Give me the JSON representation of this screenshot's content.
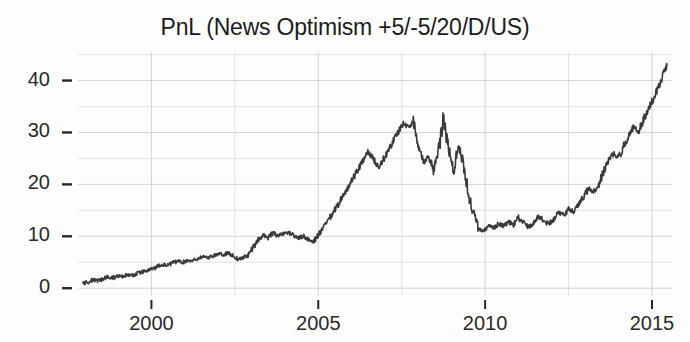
{
  "chart_data": {
    "type": "line",
    "title": "PnL (News Optimism +5/-5/20/D/US)",
    "xlabel": "",
    "ylabel": "",
    "xlim": [
      1997.8,
      2015.6
    ],
    "ylim": [
      -1.5,
      45.5
    ],
    "xticks": [
      2000,
      2005,
      2010,
      2015
    ],
    "yticks": [
      0,
      10,
      20,
      30,
      40
    ],
    "xtick_labels": [
      "2000",
      "2005",
      "2010",
      "2015"
    ],
    "ytick_labels": [
      "0",
      "10",
      "20",
      "30",
      "40"
    ],
    "y_minor_gridlines": [
      5,
      15,
      25,
      35,
      45
    ],
    "x_minor_gridlines": [
      1997.5,
      2002.5,
      2007.5,
      2012.5
    ],
    "grid": true,
    "legend": null,
    "line_color": "#3a3a3a",
    "line_width": 1.6,
    "background_color": "#fdfdfd",
    "grid_color": "#d8d8d8",
    "series": [
      {
        "name": "PnL",
        "x": [
          1997.95,
          1998.1,
          1998.25,
          1998.4,
          1998.55,
          1998.7,
          1998.85,
          1999.0,
          1999.15,
          1999.3,
          1999.45,
          1999.6,
          1999.75,
          1999.9,
          2000.05,
          2000.2,
          2000.35,
          2000.5,
          2000.65,
          2000.8,
          2000.95,
          2001.1,
          2001.25,
          2001.4,
          2001.55,
          2001.7,
          2001.85,
          2002.0,
          2002.15,
          2002.3,
          2002.45,
          2002.6,
          2002.75,
          2002.9,
          2003.05,
          2003.2,
          2003.35,
          2003.5,
          2003.65,
          2003.8,
          2003.95,
          2004.1,
          2004.25,
          2004.4,
          2004.55,
          2004.7,
          2004.85,
          2005.0,
          2005.15,
          2005.3,
          2005.45,
          2005.6,
          2005.75,
          2005.9,
          2006.05,
          2006.2,
          2006.35,
          2006.5,
          2006.65,
          2006.8,
          2006.95,
          2007.1,
          2007.25,
          2007.4,
          2007.55,
          2007.7,
          2007.85,
          2008.0,
          2008.15,
          2008.3,
          2008.45,
          2008.6,
          2008.75,
          2008.9,
          2009.05,
          2009.2,
          2009.35,
          2009.5,
          2009.65,
          2009.8,
          2009.95,
          2010.1,
          2010.25,
          2010.4,
          2010.55,
          2010.7,
          2010.85,
          2011.0,
          2011.15,
          2011.3,
          2011.45,
          2011.6,
          2011.75,
          2011.9,
          2012.05,
          2012.2,
          2012.35,
          2012.5,
          2012.65,
          2012.8,
          2012.95,
          2013.1,
          2013.25,
          2013.4,
          2013.55,
          2013.7,
          2013.85,
          2014.0,
          2014.15,
          2014.3,
          2014.45,
          2014.6,
          2014.75,
          2014.9,
          2015.05,
          2015.2,
          2015.35,
          2015.45
        ],
        "y": [
          1.0,
          1.2,
          1.6,
          1.4,
          1.8,
          2.2,
          2.0,
          2.4,
          2.3,
          2.6,
          2.5,
          2.9,
          3.2,
          3.4,
          3.8,
          4.3,
          4.6,
          4.4,
          4.9,
          5.2,
          5.0,
          5.4,
          5.3,
          5.8,
          6.1,
          5.9,
          6.3,
          6.6,
          6.4,
          6.8,
          6.2,
          5.6,
          5.9,
          6.4,
          7.8,
          9.3,
          10.2,
          9.8,
          10.6,
          10.1,
          10.4,
          10.8,
          10.2,
          9.6,
          10.0,
          9.4,
          9.0,
          10.2,
          11.6,
          13.0,
          14.6,
          16.2,
          18.0,
          19.4,
          21.2,
          23.0,
          24.6,
          26.2,
          25.0,
          23.4,
          24.8,
          26.6,
          28.4,
          30.2,
          31.8,
          31.0,
          32.0,
          28.0,
          24.2,
          25.6,
          22.8,
          26.0,
          33.0,
          27.0,
          22.5,
          27.5,
          24.0,
          18.0,
          14.5,
          11.5,
          11.0,
          12.0,
          11.6,
          12.4,
          12.0,
          12.8,
          12.2,
          13.6,
          12.6,
          11.8,
          12.6,
          14.0,
          13.0,
          12.4,
          13.2,
          14.8,
          14.0,
          15.4,
          14.8,
          16.2,
          17.6,
          19.2,
          18.4,
          20.0,
          22.4,
          24.6,
          26.0,
          25.0,
          27.4,
          29.4,
          31.0,
          30.2,
          32.6,
          34.6,
          36.6,
          39.0,
          41.4,
          43.0
        ]
      }
    ]
  }
}
